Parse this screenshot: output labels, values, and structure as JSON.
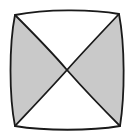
{
  "figure": {
    "name": "hourglass-bowtie-square",
    "canvas": {
      "width": 133,
      "height": 138
    },
    "background_color": "#ffffff",
    "stroke_color": "#1a1a1a",
    "stroke_width": 1.8,
    "fill_shaded": "#c9c9c9",
    "fill_unshaded": "#ffffff",
    "shaded_fraction_label": "1/2",
    "corners": {
      "top_left": {
        "x": 15,
        "y": 15
      },
      "top_right": {
        "x": 119,
        "y": 14
      },
      "bottom_right": {
        "x": 120,
        "y": 126
      },
      "bottom_left": {
        "x": 15,
        "y": 126
      }
    },
    "center": {
      "x": 67,
      "y": 70
    },
    "outline_path": "M 15 15 C 45 9, 92 9, 119 14 C 125 45, 125 95, 120 126 C 90 131, 45 131, 15 126 C 9 96, 9 45, 15 15 Z",
    "diagonal_tl_br_path": "M 15 15 C 38 38, 56 57, 67 70 C 82 87, 104 110, 120 126",
    "diagonal_tr_bl_path": "M 119 14 C 102 32, 82 53, 67 70 C 50 89, 30 110, 15 126",
    "region_left_path": "M 15 15 C 38 38, 56 57, 67 70 C 50 89, 30 110, 15 126 C 9 96, 9 45, 15 15 Z",
    "region_right_path": "M 119 14 C 102 32, 82 53, 67 70 C 82 87, 104 110, 120 126 C 125 95, 125 45, 119 14 Z",
    "region_top_path": "M 15 15 C 45 9, 92 9, 119 14 C 102 32, 82 53, 67 70 C 56 57, 38 38, 15 15 Z",
    "region_bottom_path": "M 15 126 C 45 131, 90 131, 120 126 C 104 110, 82 87, 67 70 C 50 89, 30 110, 15 126 Z",
    "regions": [
      {
        "id": "top",
        "label": "top-triangle",
        "shaded": false
      },
      {
        "id": "right",
        "label": "right-triangle",
        "shaded": true
      },
      {
        "id": "bottom",
        "label": "bottom-triangle",
        "shaded": false
      },
      {
        "id": "left",
        "label": "left-triangle",
        "shaded": true
      }
    ]
  }
}
